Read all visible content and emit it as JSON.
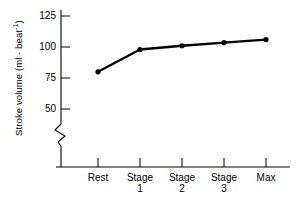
{
  "chart_data": {
    "type": "line",
    "title": "",
    "xlabel": "",
    "ylabel": "Stroke volume (ml · beat-1)",
    "ylabel_prefix": "Stroke volume (ml · beat",
    "ylabel_exponent": "-1",
    "ylabel_suffix": ")",
    "categories": [
      "Rest",
      "Stage 1",
      "Stage 2",
      "Stage 3",
      "Max"
    ],
    "category_lines": [
      [
        "Rest",
        ""
      ],
      [
        "Stage",
        "1"
      ],
      [
        "Stage",
        "2"
      ],
      [
        "Stage",
        "3"
      ],
      [
        "Max",
        ""
      ]
    ],
    "values": [
      80,
      98,
      101,
      103.5,
      106
    ],
    "yticks": [
      50,
      75,
      100,
      125
    ],
    "ylim": [
      50,
      125
    ],
    "axis_break": true,
    "grid": false,
    "legend": "none",
    "line_color": "#000000",
    "marker_color": "#000000",
    "background_color": "#ffffff"
  },
  "xlabels": {
    "0": {
      "line1": "Rest",
      "line2": ""
    },
    "1": {
      "line1": "Stage",
      "line2": "1"
    },
    "2": {
      "line1": "Stage",
      "line2": "2"
    },
    "3": {
      "line1": "Stage",
      "line2": "3"
    },
    "4": {
      "line1": "Max",
      "line2": ""
    }
  },
  "yticklabels": {
    "t125": "125",
    "t100": "100",
    "t75": "75",
    "t50": "50"
  }
}
